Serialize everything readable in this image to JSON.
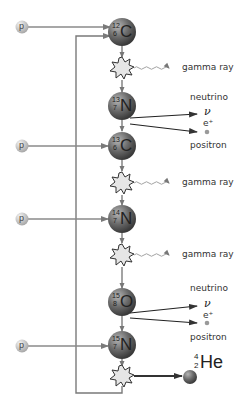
{
  "proton_label": "p",
  "nuclei": [
    {
      "id": "c12",
      "mass": "12",
      "z": "6",
      "symbol": "C"
    },
    {
      "id": "n13",
      "mass": "13",
      "z": "7",
      "symbol": "N"
    },
    {
      "id": "c13",
      "mass": "13",
      "z": "6",
      "symbol": "C"
    },
    {
      "id": "n14",
      "mass": "14",
      "z": "7",
      "symbol": "N"
    },
    {
      "id": "o15",
      "mass": "15",
      "z": "8",
      "symbol": "O"
    },
    {
      "id": "n15",
      "mass": "15",
      "z": "7",
      "symbol": "N"
    }
  ],
  "labels": {
    "gamma_ray": "gamma ray",
    "neutrino": "neutrino",
    "positron": "positron",
    "nu_symbol": "ν",
    "positron_symbol": "e⁺"
  },
  "gamma_rays": [
    {
      "label": "gamma ray"
    },
    {
      "label": "gamma ray"
    },
    {
      "label": "gamma ray"
    }
  ],
  "decays": [
    {
      "neutrino_label": "neutrino",
      "nu": "ν",
      "e": "e⁺",
      "positron_label": "positron"
    },
    {
      "neutrino_label": "neutrino",
      "nu": "ν",
      "e": "e⁺",
      "positron_label": "positron"
    }
  ],
  "helium": {
    "mass": "4",
    "z": "2",
    "symbol": "He"
  },
  "colors": {
    "nucleus_dark": "#3a3a3a",
    "nucleus_light": "#9a9a9a",
    "proton_light": "#e8e8e8",
    "proton_dark": "#a8a8a8",
    "line": "#7a7a7a",
    "arrow_dark": "#333333",
    "burst_fill": "#e6e6e6"
  }
}
